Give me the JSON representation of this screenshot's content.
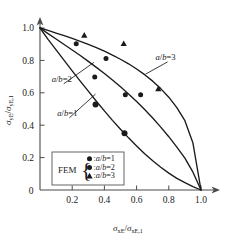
{
  "chart_data": {
    "type": "line",
    "title": "",
    "xlabel": "σxE/σxE,1",
    "ylabel": "σyE/σyE,1",
    "xlabel_parts": {
      "main1": "σ",
      "sub1": "xE",
      "slash": "/",
      "main2": "σ",
      "sub2": "xE,1"
    },
    "ylabel_parts": {
      "main1": "σ",
      "sub1": "yE",
      "slash": "/",
      "main2": "σ",
      "sub2": "yE,1"
    },
    "xlim": [
      0,
      1.0
    ],
    "ylim": [
      0,
      1.0
    ],
    "grid": false,
    "legend_position": "lower-left-inside",
    "xticks": [
      "0",
      "0.2",
      "0.4",
      "0.6",
      "0.8",
      "1.0"
    ],
    "xtick_values": [
      0,
      0.2,
      0.4,
      0.6,
      0.8,
      1.0
    ],
    "yticks": [
      "0",
      "0.2",
      "0.4",
      "0.6",
      "0.8",
      "1.0"
    ],
    "ytick_values": [
      0,
      0.2,
      0.4,
      0.6,
      0.8,
      1.0
    ],
    "series": [
      {
        "name": "a/b=1",
        "kind": "curve",
        "style": "solid",
        "points": [
          [
            0.0,
            1.0
          ],
          [
            0.05,
            0.93
          ],
          [
            0.1,
            0.865
          ],
          [
            0.15,
            0.8
          ],
          [
            0.2,
            0.735
          ],
          [
            0.25,
            0.672
          ],
          [
            0.3,
            0.61
          ],
          [
            0.35,
            0.548
          ],
          [
            0.4,
            0.488
          ],
          [
            0.45,
            0.43
          ],
          [
            0.5,
            0.375
          ],
          [
            0.55,
            0.322
          ],
          [
            0.6,
            0.272
          ],
          [
            0.65,
            0.224
          ],
          [
            0.7,
            0.18
          ],
          [
            0.75,
            0.14
          ],
          [
            0.8,
            0.104
          ],
          [
            0.85,
            0.072
          ],
          [
            0.9,
            0.045
          ],
          [
            0.95,
            0.021
          ],
          [
            1.0,
            0.0
          ]
        ]
      },
      {
        "name": "a/b=2",
        "kind": "curve",
        "style": "solid",
        "points": [
          [
            0.0,
            1.0
          ],
          [
            0.05,
            0.965
          ],
          [
            0.1,
            0.932
          ],
          [
            0.15,
            0.898
          ],
          [
            0.2,
            0.864
          ],
          [
            0.25,
            0.83
          ],
          [
            0.3,
            0.794
          ],
          [
            0.35,
            0.757
          ],
          [
            0.4,
            0.719
          ],
          [
            0.45,
            0.679
          ],
          [
            0.5,
            0.637
          ],
          [
            0.55,
            0.593
          ],
          [
            0.6,
            0.546
          ],
          [
            0.65,
            0.497
          ],
          [
            0.7,
            0.444
          ],
          [
            0.75,
            0.388
          ],
          [
            0.8,
            0.329
          ],
          [
            0.85,
            0.265
          ],
          [
            0.9,
            0.197
          ],
          [
            0.95,
            0.11
          ],
          [
            1.0,
            0.0
          ]
        ]
      },
      {
        "name": "a/b=3",
        "kind": "curve",
        "style": "solid",
        "points": [
          [
            0.0,
            1.0
          ],
          [
            0.05,
            0.985
          ],
          [
            0.1,
            0.969
          ],
          [
            0.15,
            0.953
          ],
          [
            0.2,
            0.936
          ],
          [
            0.25,
            0.918
          ],
          [
            0.3,
            0.899
          ],
          [
            0.35,
            0.879
          ],
          [
            0.4,
            0.857
          ],
          [
            0.45,
            0.833
          ],
          [
            0.5,
            0.807
          ],
          [
            0.55,
            0.779
          ],
          [
            0.6,
            0.747
          ],
          [
            0.65,
            0.712
          ],
          [
            0.7,
            0.672
          ],
          [
            0.75,
            0.626
          ],
          [
            0.8,
            0.573
          ],
          [
            0.85,
            0.508
          ],
          [
            0.9,
            0.428
          ],
          [
            0.95,
            0.29
          ],
          [
            1.0,
            0.0
          ]
        ]
      },
      {
        "name": "FEM a/b=1",
        "kind": "scatter",
        "marker": "circle-large",
        "points": [
          [
            0.345,
            0.528
          ],
          [
            0.525,
            0.35
          ]
        ]
      },
      {
        "name": "FEM a/b=2",
        "kind": "scatter",
        "marker": "circle-small",
        "points": [
          [
            0.225,
            0.903
          ],
          [
            0.34,
            0.698
          ],
          [
            0.41,
            0.812
          ],
          [
            0.53,
            0.588
          ],
          [
            0.625,
            0.588
          ]
        ]
      },
      {
        "name": "FEM a/b=3",
        "kind": "scatter",
        "marker": "triangle",
        "points": [
          [
            0.275,
            0.955
          ],
          [
            0.52,
            0.903
          ],
          [
            0.735,
            0.625
          ]
        ]
      }
    ],
    "annotations": [
      {
        "text": "a/b=3",
        "x": 0.78,
        "y": 0.8,
        "leader_to": [
          0.655,
          0.715
        ]
      },
      {
        "text": "a/b=2",
        "x": 0.135,
        "y": 0.665,
        "leader_to": [
          0.335,
          0.788
        ]
      },
      {
        "text": "a/b=1",
        "x": 0.17,
        "y": 0.455,
        "leader_to": [
          0.345,
          0.592
        ]
      }
    ]
  },
  "legend": {
    "label": "FEM",
    "brace": "{",
    "entries": [
      {
        "marker": "circle-small",
        "text": ":a/b=1",
        "prefix": ":",
        "italic_a": "a",
        "slash": "/",
        "italic_b": "b",
        "eq": "=1"
      },
      {
        "marker": "circle-small",
        "text": ":a/b=2",
        "prefix": ":",
        "italic_a": "a",
        "slash": "/",
        "italic_b": "b",
        "eq": "=2"
      },
      {
        "marker": "triangle",
        "text": ":a/b=3",
        "prefix": ":",
        "italic_a": "a",
        "slash": "/",
        "italic_b": "b",
        "eq": "=3"
      }
    ]
  },
  "colors": {
    "line": "#1a1a1a",
    "axis": "#4a4a4a",
    "text": "#1a1a1a",
    "background": "#ffffff",
    "legend_border": "#555555"
  }
}
